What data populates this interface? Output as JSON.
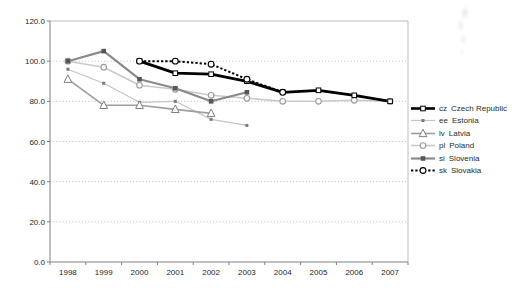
{
  "chart_data": {
    "type": "line",
    "title": "",
    "categories": [
      "1998",
      "1999",
      "2000",
      "2001",
      "2002",
      "2003",
      "2004",
      "2005",
      "2006",
      "2007"
    ],
    "x_axis": {
      "tick_labels": [
        "1998",
        "1999",
        "2000",
        "2001",
        "2002",
        "2003",
        "2004",
        "2005",
        "2006",
        "2007"
      ]
    },
    "y_axis": {
      "min": 0,
      "max": 120,
      "step": 20,
      "tick_labels": [
        "0.0",
        "20.0",
        "40.0",
        "60.0",
        "80.0",
        "100.0",
        "120.0"
      ]
    },
    "grid": "horizontal-dotted",
    "legend": {
      "position": "right"
    },
    "axis_color": "#808080",
    "plot_border_color": "#bdbdbd",
    "gridline_color": "#bdbdbd",
    "series": [
      {
        "code": "cz",
        "name": "Czech Republic",
        "color": "#000000",
        "line_width": 2.8,
        "dash": "solid",
        "marker": "open-square",
        "marker_color": "#000000",
        "marker_size": 4.6,
        "values": [
          null,
          null,
          100,
          94,
          93.5,
          90,
          84.5,
          85.5,
          83,
          80
        ]
      },
      {
        "code": "ee",
        "name": "Estonia",
        "color": "#c4c4c4",
        "line_width": 1.2,
        "dash": "solid",
        "marker": "filled-square",
        "marker_color": "#7a7a7a",
        "marker_size": 3,
        "values": [
          96,
          89,
          79.5,
          80,
          71,
          68,
          null,
          null,
          null,
          null
        ]
      },
      {
        "code": "lv",
        "name": "Latvia",
        "color": "#9e9e9e",
        "line_width": 1.6,
        "dash": "solid",
        "marker": "open-triangle",
        "marker_color": "#7f7f7f",
        "marker_size": 7,
        "values": [
          91,
          78,
          78,
          76,
          74,
          null,
          null,
          null,
          null,
          null
        ]
      },
      {
        "code": "pl",
        "name": "Poland",
        "color": "#c9c9c9",
        "line_width": 1.6,
        "dash": "solid",
        "marker": "open-circle",
        "marker_color": "#999999",
        "marker_size": 5.6,
        "values": [
          100,
          97,
          88,
          86,
          83,
          81.5,
          80,
          80,
          80.5,
          80
        ]
      },
      {
        "code": "si",
        "name": "Slovenia",
        "color": "#8a8a8a",
        "line_width": 2.2,
        "dash": "solid",
        "marker": "filled-square",
        "marker_color": "#575757",
        "marker_size": 4.6,
        "values": [
          100,
          105,
          91,
          86.5,
          80,
          84.5,
          null,
          null,
          null,
          null
        ]
      },
      {
        "code": "sk",
        "name": "Slovakia",
        "color": "#000000",
        "line_width": 2,
        "dash": "dotted",
        "marker": "open-circle",
        "marker_color": "#000000",
        "marker_size": 5.8,
        "values": [
          null,
          null,
          100,
          100,
          98.5,
          91,
          84.5,
          null,
          null,
          null
        ]
      }
    ]
  }
}
